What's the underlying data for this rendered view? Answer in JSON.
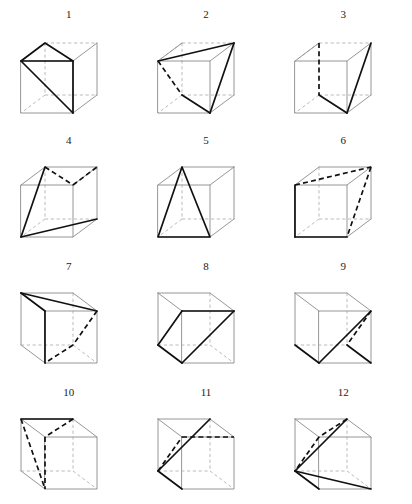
{
  "figure": {
    "rows": 4,
    "columns": 3,
    "count": 12,
    "colors": {
      "background": "#ffffff",
      "cube_visible_edge": "#8a8a8a",
      "cube_hidden_edge": "#a8a8a8",
      "triangle_solid": "#111111",
      "triangle_dashed": "#111111",
      "label_text": "#222222"
    }
  },
  "cubes": [
    {
      "label": "1",
      "hidden_vertex": "back-top-left",
      "triangle_vertices": [
        "front-top-left",
        "back-top-right",
        "front-bottom-right"
      ],
      "triangle_style": "solid",
      "row": 1,
      "column": 1
    },
    {
      "label": "2",
      "hidden_vertex": "back-top-left",
      "triangle_vertices": [
        "front-top-left",
        "back-top-right",
        "front-bottom-right"
      ],
      "triangle_style": "mixed",
      "row": 1,
      "column": 2
    },
    {
      "label": "3",
      "hidden_vertex": "back-top-left",
      "triangle_vertices": [
        "back-top-left",
        "back-bottom-left",
        "front-bottom-right"
      ],
      "triangle_style": "mixed",
      "row": 1,
      "column": 3
    },
    {
      "label": "4",
      "hidden_vertex": "back-bottom-right",
      "triangle_vertices": [
        "front-top-left",
        "back-top-right",
        "front-bottom-left"
      ],
      "triangle_style": "mixed",
      "row": 2,
      "column": 1
    },
    {
      "label": "5",
      "hidden_vertex": "back-bottom-right",
      "triangle_vertices": [
        "front-top-left",
        "front-bottom-left",
        "front-bottom-right"
      ],
      "triangle_style": "solid",
      "row": 2,
      "column": 2
    },
    {
      "label": "6",
      "hidden_vertex": "back-bottom-right",
      "triangle_vertices": [
        "back-top-left",
        "back-top-right",
        "front-bottom-right"
      ],
      "triangle_style": "mixed",
      "row": 2,
      "column": 3
    },
    {
      "label": "7",
      "hidden_vertex": "back-top-right",
      "triangle_vertices": [
        "back-top-left",
        "front-top-right",
        "front-bottom-left"
      ],
      "triangle_style": "mixed",
      "row": 3,
      "column": 1
    },
    {
      "label": "8",
      "hidden_vertex": "back-top-right",
      "triangle_vertices": [
        "front-top-left",
        "front-bottom-left",
        "front-top-right"
      ],
      "triangle_style": "solid",
      "row": 3,
      "column": 2
    },
    {
      "label": "9",
      "hidden_vertex": "back-top-right",
      "triangle_vertices": [
        "front-top-right",
        "front-bottom-left",
        "back-bottom-right"
      ],
      "triangle_style": "mixed",
      "row": 3,
      "column": 3
    },
    {
      "label": "10",
      "hidden_vertex": "back-top-right",
      "triangle_vertices": [
        "back-top-left",
        "front-top-right",
        "front-bottom-left"
      ],
      "triangle_style": "dashed",
      "row": 4,
      "column": 1
    },
    {
      "label": "11",
      "hidden_vertex": "back-top-right",
      "triangle_vertices": [
        "back-top-left",
        "front-top-right",
        "front-bottom-left"
      ],
      "triangle_style": "mixed",
      "row": 4,
      "column": 2
    },
    {
      "label": "12",
      "hidden_vertex": "back-top-right",
      "triangle_vertices": [
        "back-top-left",
        "front-top-right",
        "front-bottom-left",
        "front-bottom-right"
      ],
      "triangle_style": "mixed",
      "row": 4,
      "column": 3
    }
  ]
}
